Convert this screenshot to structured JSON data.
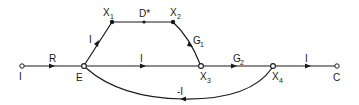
{
  "diagram": {
    "type": "signal-flow-graph",
    "nodes": [
      {
        "id": "I",
        "label": "I",
        "sub": "",
        "x": 22,
        "y": 66,
        "style": "open",
        "label_pos": "below"
      },
      {
        "id": "E",
        "label": "E",
        "sub": "",
        "x": 84,
        "y": 66,
        "style": "open",
        "label_pos": "below"
      },
      {
        "id": "X1",
        "label": "X",
        "sub": "1",
        "x": 112,
        "y": 22,
        "style": "filled",
        "label_pos": "above"
      },
      {
        "id": "X2",
        "label": "X",
        "sub": "2",
        "x": 173,
        "y": 22,
        "style": "filled",
        "label_pos": "above"
      },
      {
        "id": "X3",
        "label": "X",
        "sub": "3",
        "x": 201,
        "y": 66,
        "style": "open",
        "label_pos": "below"
      },
      {
        "id": "X4",
        "label": "X",
        "sub": "4",
        "x": 273,
        "y": 66,
        "style": "open",
        "label_pos": "below"
      },
      {
        "id": "C",
        "label": "C",
        "sub": "",
        "x": 337,
        "y": 66,
        "style": "open",
        "label_pos": "below"
      }
    ],
    "edges": [
      {
        "from": "I",
        "to": "E",
        "gain": "R",
        "gain_sub": ""
      },
      {
        "from": "E",
        "to": "X1",
        "gain": "I",
        "gain_sub": ""
      },
      {
        "from": "X1",
        "to": "X2",
        "gain": "D*",
        "gain_sub": ""
      },
      {
        "from": "X2",
        "to": "X3",
        "gain": "G",
        "gain_sub": "1"
      },
      {
        "from": "E",
        "to": "X3",
        "gain": "I",
        "gain_sub": ""
      },
      {
        "from": "X3",
        "to": "X4",
        "gain": "G",
        "gain_sub": "2"
      },
      {
        "from": "X4",
        "to": "C",
        "gain": "I",
        "gain_sub": ""
      },
      {
        "from": "X4",
        "to": "E",
        "gain": "-I",
        "gain_sub": ""
      }
    ]
  },
  "labels": {
    "node_I": "I",
    "node_E": "E",
    "node_X1": "X",
    "node_X1_sub": "1",
    "node_X2": "X",
    "node_X2_sub": "2",
    "node_X3": "X",
    "node_X3_sub": "3",
    "node_X4": "X",
    "node_X4_sub": "4",
    "node_C": "C",
    "edge_R": "R",
    "edge_E_X1": "I",
    "edge_D": "D*",
    "edge_G1": "G",
    "edge_G1_sub": "1",
    "edge_E_X3": "I",
    "edge_G2": "G",
    "edge_G2_sub": "2",
    "edge_X4_C": "I",
    "edge_feedback": "-I"
  }
}
